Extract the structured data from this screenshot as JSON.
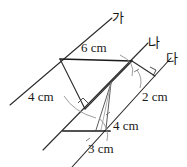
{
  "figure": {
    "type": "geometry-diagram",
    "background_color": "#ffffff",
    "stroke_color": "#2b2b2b",
    "line_names": [
      {
        "id": "line-ga",
        "label": "가"
      },
      {
        "id": "line-na",
        "label": "나"
      },
      {
        "id": "line-da",
        "label": "다"
      }
    ],
    "measurements": [
      {
        "id": "top-segment",
        "label": "6 cm",
        "value": 6,
        "unit": "cm"
      },
      {
        "id": "left-segment",
        "label": "4 cm",
        "value": 4,
        "unit": "cm"
      },
      {
        "id": "right-segment",
        "label": "2 cm",
        "value": 2,
        "unit": "cm"
      },
      {
        "id": "mid-segment",
        "label": "4 cm",
        "value": 4,
        "unit": "cm"
      },
      {
        "id": "bottom-segment",
        "label": "3 cm",
        "value": 3,
        "unit": "cm"
      }
    ],
    "right_angle_marks": 3,
    "arc_marks": 4
  }
}
